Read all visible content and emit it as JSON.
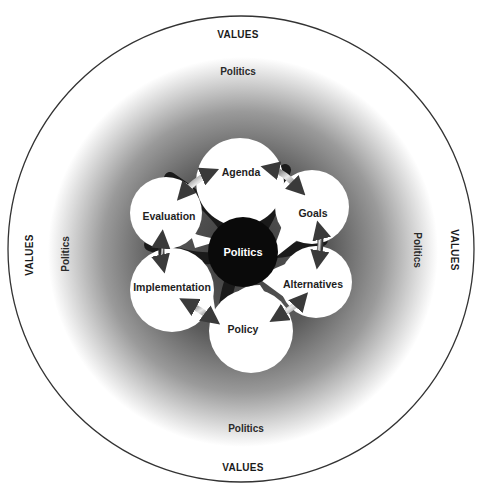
{
  "diagram": {
    "outer_ring": {
      "label": "VALUES",
      "labels": {
        "top": "VALUES",
        "bottom": "VALUES",
        "left": "VALUES",
        "right": "VALUES"
      }
    },
    "middle_ring": {
      "label": "Politics",
      "labels": {
        "top": "Politics",
        "bottom": "Politics",
        "left": "Politics",
        "right": "Politics"
      }
    },
    "center": {
      "label": "Politics"
    },
    "stages": [
      {
        "id": "agenda",
        "label": "Agenda"
      },
      {
        "id": "goals",
        "label": "Goals"
      },
      {
        "id": "alternatives",
        "label": "Alternatives"
      },
      {
        "id": "policy",
        "label": "Policy"
      },
      {
        "id": "implementation",
        "label": "Implementation"
      },
      {
        "id": "evaluation",
        "label": "Evaluation"
      }
    ],
    "arrows": [
      {
        "from": "Agenda",
        "to": "Goals",
        "type": "bidirectional"
      },
      {
        "from": "Goals",
        "to": "Alternatives",
        "type": "bidirectional"
      },
      {
        "from": "Alternatives",
        "to": "Policy",
        "type": "bidirectional"
      },
      {
        "from": "Policy",
        "to": "Implementation",
        "type": "bidirectional"
      },
      {
        "from": "Implementation",
        "to": "Evaluation",
        "type": "bidirectional"
      },
      {
        "from": "Evaluation",
        "to": "Agenda",
        "type": "bidirectional"
      }
    ],
    "colors": {
      "outer_ring_stroke": "#333333",
      "gradient_dark": "#4a4a4a",
      "gradient_light": "#ffffff",
      "center_fill": "#0a0a0a",
      "petal_fill": "#ffffff"
    }
  }
}
